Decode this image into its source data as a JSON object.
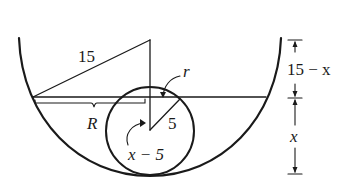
{
  "diagram": {
    "type": "geometry",
    "labels": {
      "hypotenuse": "15",
      "small_r": "r",
      "big_R": "R",
      "sphere_radius": "5",
      "x_minus_5": "x − 5",
      "top_dim": "15 − x",
      "bottom_dim": "x"
    },
    "colors": {
      "stroke": "#1a1a1a",
      "background": "#ffffff"
    }
  }
}
